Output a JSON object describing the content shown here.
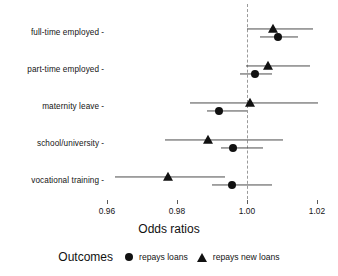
{
  "chart_data": {
    "type": "scatter",
    "title": "",
    "xlabel": "Odds ratios",
    "ylabel": "",
    "xlim": [
      0.9555,
      1.0255
    ],
    "xticks": [
      0.96,
      0.98,
      1.0,
      1.02
    ],
    "xtick_labels": [
      "0.96",
      "0.98",
      "1.00",
      "1.02"
    ],
    "categories": [
      "full-time employed",
      "part-time employed",
      "maternity leave",
      "school/university",
      "vocational training"
    ],
    "reference_line": 1.0,
    "grid": false,
    "legend_position": "bottom",
    "legend_title": "Outcomes",
    "series": [
      {
        "name": "repays loans",
        "marker": "circle",
        "values": [
          1.0089,
          1.0023,
          0.992,
          0.9961,
          0.9957
        ],
        "ci_low": [
          1.0037,
          0.998,
          0.9886,
          0.9926,
          0.99
        ],
        "ci_high": [
          1.0146,
          1.0071,
          1.0,
          1.0046,
          1.0071
        ]
      },
      {
        "name": "repays new loans",
        "marker": "triangle",
        "values": [
          1.0074,
          1.006,
          1.0009,
          0.9889,
          0.9774
        ],
        "ci_low": [
          1.0,
          0.9997,
          0.9837,
          0.9766,
          0.9623
        ],
        "ci_high": [
          1.0189,
          1.018,
          1.0203,
          1.0103,
          0.9937
        ]
      }
    ],
    "annotations": []
  },
  "axis": {
    "x_title": "Odds ratios"
  },
  "legend": {
    "title": "Outcomes",
    "entries": [
      {
        "label": "repays loans",
        "marker": "circle"
      },
      {
        "label": "repays new loans",
        "marker": "triangle"
      }
    ]
  }
}
